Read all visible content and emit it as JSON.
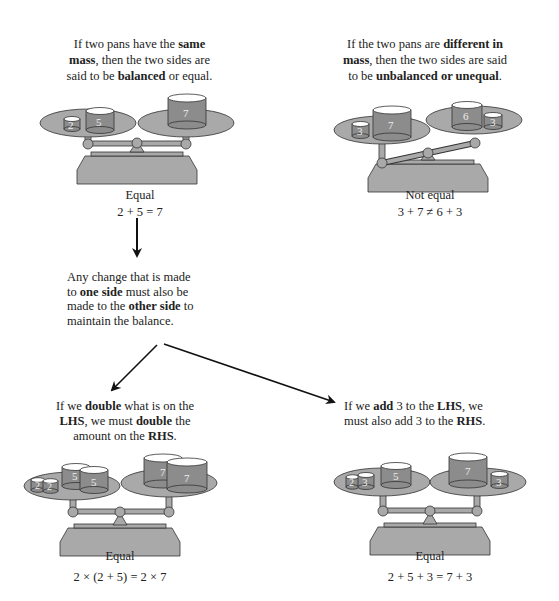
{
  "panels": {
    "top_left": {
      "caption_parts": [
        "If two pans have the ",
        "same",
        " mass",
        ", then the two sides are said to be ",
        "balanced",
        " or equal."
      ],
      "line1_a": "If two pans have the ",
      "line1_b": "same",
      "line2_a": "mass",
      "line2_b": ", then the two sides are",
      "line3_a": "said to be ",
      "line3_b": "balanced",
      "line3_c": " or equal.",
      "status": "Equal",
      "equation": "2 + 5 = 7",
      "left_weights": [
        "2",
        "5"
      ],
      "right_weights": [
        "7"
      ]
    },
    "top_right": {
      "line1_a": "If the two pans are ",
      "line1_b": "different in",
      "line2_a": "mass",
      "line2_b": ", then the two sides are said",
      "line3_a": "to be ",
      "line3_b": "unbalanced or unequal",
      "line3_c": ".",
      "status": "Not equal",
      "equation": "3 + 7 ≠ 6 + 3",
      "left_weights": [
        "3",
        "7"
      ],
      "right_weights": [
        "6",
        "3"
      ]
    },
    "middle": {
      "line1": "Any change that is made",
      "line2_a": "to ",
      "line2_b": "one side",
      "line2_c": " must also be",
      "line3_a": "made to the ",
      "line3_b": "other side",
      "line3_c": " to",
      "line4": "maintain the balance."
    },
    "bottom_left": {
      "line1_a": "If we ",
      "line1_b": "double",
      "line1_c": " what is on the",
      "line2_a": "LHS",
      "line2_b": ", we must ",
      "line2_c": "double",
      "line2_d": " the",
      "line3_a": "amount on the ",
      "line3_b": "RHS",
      "line3_c": ".",
      "status": "Equal",
      "equation": "2 × (2 + 5) = 2 × 7",
      "left_weights": [
        "2",
        "2",
        "5",
        "5"
      ],
      "right_weights": [
        "7",
        "7"
      ]
    },
    "bottom_right": {
      "line1_a": "If we ",
      "line1_b": "add",
      "line1_c": " 3 to the ",
      "line1_d": "LHS",
      "line1_e": ", we",
      "line2_a": "must also add 3 to the ",
      "line2_b": "RHS",
      "line2_c": ".",
      "status": "Equal",
      "equation": "2 + 5 + 3 = 7 + 3",
      "left_weights": [
        "2",
        "3",
        "5"
      ],
      "right_weights": [
        "7",
        "3"
      ]
    }
  },
  "colors": {
    "pan_fill": "#a9a9a9",
    "weight_fill": "#8c8c8c",
    "weight_top": "#ffffff",
    "outline": "#333333",
    "arrow": "#111111"
  }
}
